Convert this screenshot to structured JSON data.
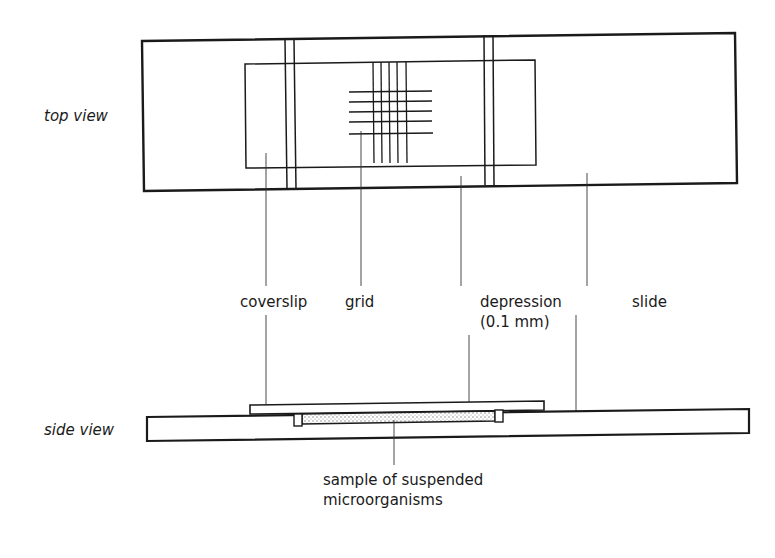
{
  "diagram": {
    "view_labels": {
      "top": "top view",
      "side": "side view"
    },
    "callouts": {
      "coverslip": "coverslip",
      "grid": "grid",
      "depression_line1": "depression",
      "depression_line2": "(0.1 mm)",
      "slide": "slide",
      "sample_line1": "sample of suspended",
      "sample_line2": "microorganisms"
    },
    "colors": {
      "stroke": "#1a1a1a",
      "background": "#ffffff",
      "sample_fill": "#d8d8d8"
    }
  }
}
